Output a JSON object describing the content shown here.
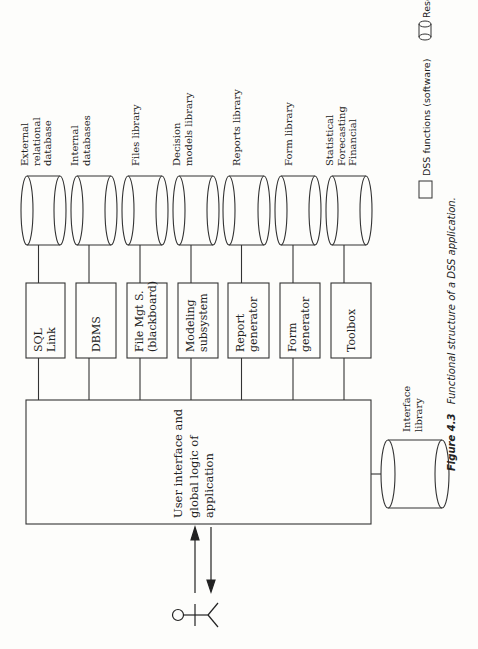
{
  "diagram": {
    "main_box": {
      "lines": [
        "User interface and",
        "global logic of",
        "application"
      ]
    },
    "functions": [
      {
        "lines": [
          "SQL",
          "Link"
        ]
      },
      {
        "lines": [
          "DBMS"
        ]
      },
      {
        "lines": [
          "File Mgt S.",
          "(blackboard)"
        ]
      },
      {
        "lines": [
          "Modeling",
          "subsystem"
        ]
      },
      {
        "lines": [
          "Report",
          "generator"
        ]
      },
      {
        "lines": [
          "Form",
          "generator"
        ]
      },
      {
        "lines": [
          "Toolbox"
        ]
      }
    ],
    "resources": [
      {
        "lines": [
          "External",
          "relational",
          "database"
        ]
      },
      {
        "lines": [
          "Internal",
          "databases"
        ]
      },
      {
        "lines": [
          "Files library"
        ]
      },
      {
        "lines": [
          "Decision",
          "models library"
        ]
      },
      {
        "lines": [
          "Reports library"
        ]
      },
      {
        "lines": [
          "Form library"
        ]
      },
      {
        "lines": [
          "Statistical",
          "Forecasting",
          "Financial"
        ]
      }
    ],
    "interface_library": {
      "lines": [
        "Interface",
        "library"
      ]
    },
    "actor": "user",
    "legend": {
      "functions_label": "DSS functions (software)",
      "resources_label": "Resources (user defined)"
    },
    "caption": {
      "figure_label": "Figure 4.3",
      "text": "Functional structure of a DSS application."
    }
  }
}
